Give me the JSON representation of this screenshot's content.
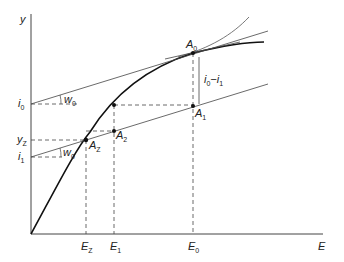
{
  "diagram": {
    "axis_labels": {
      "y": "y",
      "x": "E"
    },
    "y_ticks": [
      {
        "base": "i",
        "sub": "0"
      },
      {
        "base": "y",
        "sub": "Z"
      },
      {
        "base": "i",
        "sub": "1"
      }
    ],
    "x_ticks": [
      {
        "base": "E",
        "sub": "Z"
      },
      {
        "base": "E",
        "sub": "1"
      },
      {
        "base": "E",
        "sub": "0"
      }
    ],
    "points": [
      {
        "base": "A",
        "sub": "0"
      },
      {
        "base": "A",
        "sub": "1"
      },
      {
        "base": "A",
        "sub": "2"
      },
      {
        "base": "A",
        "sub": "Z"
      }
    ],
    "angles": [
      {
        "base": "w",
        "sub": "0"
      },
      {
        "base": "w",
        "sub": "0"
      }
    ],
    "bracket_label": {
      "a": "i",
      "a_sub": "0",
      "sep": "−",
      "b": "i",
      "b_sub": "1"
    },
    "colors": {
      "ink": "#222222",
      "background": "#ffffff"
    }
  }
}
